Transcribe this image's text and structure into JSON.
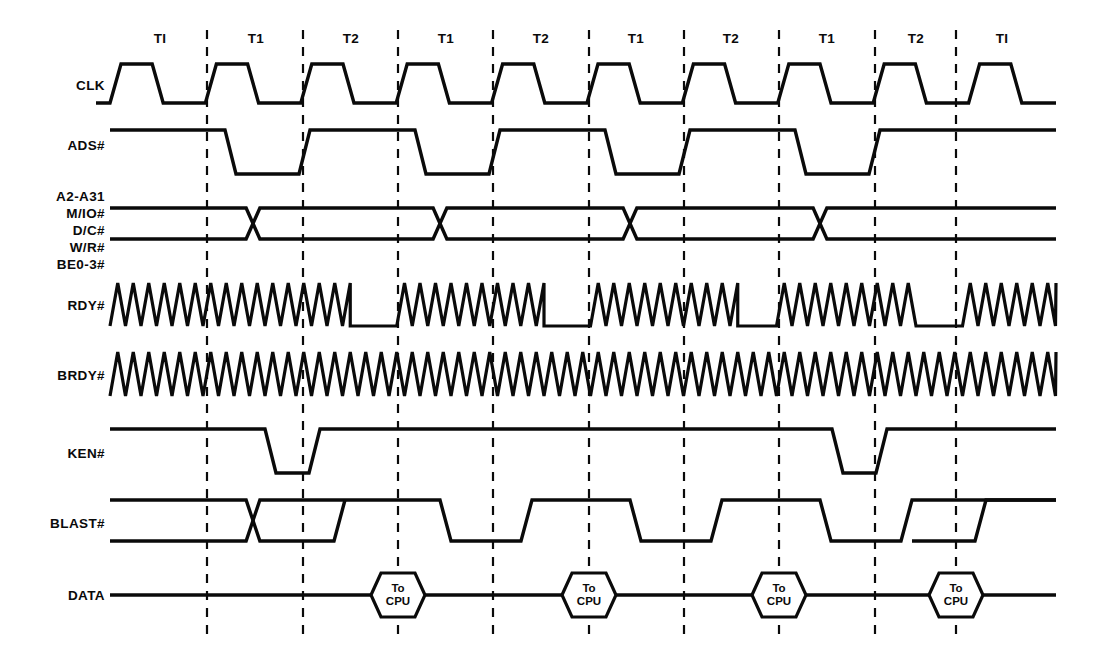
{
  "diagram": {
    "background": "#ffffff",
    "ink": "#0a0a0a",
    "geometry": {
      "x_start": 110,
      "x_end": 1056,
      "clock_period": 95.4,
      "edge_slope": 11,
      "first_rise": 110,
      "gridlines": [
        207,
        303,
        398,
        493,
        589,
        684,
        779,
        875,
        956
      ]
    },
    "period_labels": [
      {
        "text": "TI",
        "x": 160,
        "y": 43
      },
      {
        "text": "T1",
        "x": 256,
        "y": 43
      },
      {
        "text": "T2",
        "x": 351,
        "y": 43
      },
      {
        "text": "T1",
        "x": 446,
        "y": 43
      },
      {
        "text": "T2",
        "x": 541,
        "y": 43
      },
      {
        "text": "T1",
        "x": 636,
        "y": 43
      },
      {
        "text": "T2",
        "x": 731,
        "y": 43
      },
      {
        "text": "T1",
        "x": 827,
        "y": 43
      },
      {
        "text": "T2",
        "x": 916,
        "y": 43
      },
      {
        "text": "TI",
        "x": 1002,
        "y": 43
      }
    ],
    "signals": [
      {
        "name": "CLK",
        "label": "CLK",
        "label_x": 105,
        "label_y": 90,
        "type": "clock",
        "y_high": 64,
        "y_low": 103
      },
      {
        "name": "ADS#",
        "label": "ADS#",
        "label_x": 105,
        "label_y": 150,
        "type": "level",
        "y_high": 130,
        "y_low": 174,
        "low_intervals": [
          [
            225,
            310
          ],
          [
            415,
            500
          ],
          [
            605,
            690
          ],
          [
            795,
            880
          ]
        ]
      },
      {
        "name": "BUS",
        "label_lines": [
          "A2-A31",
          "M/IO#",
          "D/C#",
          "W/R#",
          "BE0-3#"
        ],
        "label_x": 105,
        "label_y_start": 201,
        "label_line_height": 17,
        "type": "bus",
        "y_high": 208,
        "y_low": 239,
        "crossings": [
          253,
          440,
          630,
          820
        ]
      },
      {
        "name": "RDY#",
        "label": "RDY#",
        "label_x": 105,
        "label_y": 310,
        "type": "zigzag_gap",
        "y_high": 283,
        "y_low": 326,
        "zig_pitch": 15.5,
        "quiet_intervals": [
          [
            348,
            400
          ],
          [
            540,
            592
          ],
          [
            731,
            783
          ],
          [
            913,
            963
          ]
        ]
      },
      {
        "name": "BRDY#",
        "label": "BRDY#",
        "label_x": 105,
        "label_y": 380,
        "type": "zigzag",
        "y_high": 352,
        "y_low": 396,
        "zig_pitch": 15.5,
        "quiet_intervals": []
      },
      {
        "name": "KEN#",
        "label": "KEN#",
        "label_x": 105,
        "label_y": 458,
        "type": "level",
        "y_high": 429,
        "y_low": 473,
        "low_intervals": [
          [
            265,
            320
          ],
          [
            832,
            887
          ]
        ]
      },
      {
        "name": "BLAST#",
        "label": "BLAST#",
        "label_x": 105,
        "label_y": 528,
        "type": "blast",
        "y_high": 500,
        "y_low": 541,
        "cross_start": 253,
        "merge_at": 345,
        "low_intervals": [
          [
            440,
            532
          ],
          [
            630,
            722
          ],
          [
            820,
            912
          ]
        ],
        "final_rise": 975
      },
      {
        "name": "DATA",
        "label": "DATA",
        "label_x": 105,
        "label_y": 600,
        "type": "data",
        "y_mid": 595,
        "hex_half_width": 27,
        "hex_half_height": 22,
        "hex_notch": 10,
        "hexes": [
          {
            "cx": 398,
            "lines": [
              "To",
              "CPU"
            ]
          },
          {
            "cx": 589,
            "lines": [
              "To",
              "CPU"
            ]
          },
          {
            "cx": 779,
            "lines": [
              "To",
              "CPU"
            ]
          },
          {
            "cx": 956,
            "lines": [
              "To",
              "CPU"
            ]
          }
        ]
      }
    ],
    "gridline_span": {
      "y_top": 30,
      "y_bottom": 640
    }
  }
}
